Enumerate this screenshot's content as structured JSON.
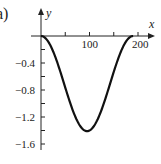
{
  "panel": {
    "label": "a)"
  },
  "chart_data": {
    "type": "line",
    "title": "",
    "xlabel": "x",
    "ylabel": "y",
    "xlim": [
      0,
      210
    ],
    "ylim": [
      -1.65,
      0.25
    ],
    "x_ticks": [
      50,
      100,
      150,
      200
    ],
    "x_tick_labels": [
      "",
      "100",
      "",
      "200"
    ],
    "y_ticks": [
      -0.2,
      -0.4,
      -0.6,
      -0.8,
      -1.0,
      -1.2,
      -1.4,
      -1.6
    ],
    "y_tick_labels": [
      "",
      "-0.4",
      "",
      "-0.8",
      "",
      "-1.2",
      "",
      "-1.6"
    ],
    "grid": false,
    "legend": null,
    "series": [
      {
        "name": "y(x)",
        "x": [
          0,
          10,
          20,
          30,
          40,
          50,
          60,
          70,
          80,
          90,
          95,
          100,
          110,
          120,
          130,
          140,
          150,
          160,
          170,
          180,
          190
        ],
        "y": [
          0,
          -0.04,
          -0.15,
          -0.32,
          -0.53,
          -0.76,
          -0.97,
          -1.17,
          -1.32,
          -1.4,
          -1.41,
          -1.4,
          -1.32,
          -1.17,
          -0.97,
          -0.76,
          -0.53,
          -0.32,
          -0.15,
          -0.04,
          0
        ]
      }
    ],
    "annotations": [
      "a)"
    ],
    "colors": {
      "line": "#111111",
      "axis": "#222222"
    }
  }
}
